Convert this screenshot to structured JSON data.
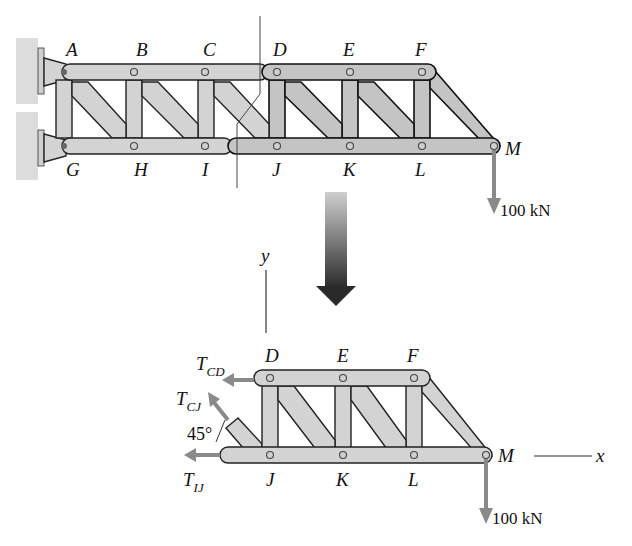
{
  "figure": {
    "upper_truss": {
      "top_joints": [
        "A",
        "B",
        "C",
        "D",
        "E",
        "F"
      ],
      "bottom_joints": [
        "G",
        "H",
        "I",
        "J",
        "K",
        "L",
        "M"
      ],
      "load": {
        "joint": "M",
        "label": "100 kN",
        "direction": "down"
      },
      "section_cut": "through members CD, CJ, IJ"
    },
    "transition_arrow": {
      "direction": "down"
    },
    "free_body": {
      "top_joints": [
        "D",
        "E",
        "F"
      ],
      "bottom_joints": [
        "J",
        "K",
        "L",
        "M"
      ],
      "forces": {
        "t_cd": {
          "symbol": "T",
          "subscript": "CD"
        },
        "t_cj": {
          "symbol": "T",
          "subscript": "CJ"
        },
        "t_ij": {
          "symbol": "T",
          "subscript": "IJ"
        }
      },
      "angle_label": "45°",
      "load_label": "100 kN",
      "axes": {
        "x": "x",
        "y": "y"
      }
    }
  }
}
